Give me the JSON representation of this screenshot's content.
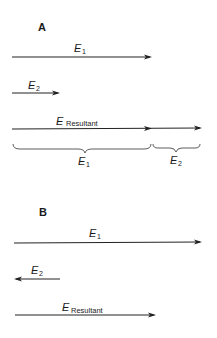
{
  "panels": [
    {
      "label": "A",
      "vectors": [
        {
          "name": "E1",
          "symbol": "E",
          "subscript": "1",
          "direction": "right",
          "x_start": 12,
          "x_end": 152
        },
        {
          "name": "E2",
          "symbol": "E",
          "subscript": "2",
          "direction": "right",
          "x_start": 12,
          "x_end": 60
        },
        {
          "name": "E_Resultant",
          "symbol": "E",
          "subscript": "Resultant",
          "direction": "right",
          "x_start": 12,
          "x_end": 202
        }
      ],
      "braces": [
        {
          "symbol": "E",
          "subscript": "1",
          "x_start": 13,
          "x_end": 151
        },
        {
          "symbol": "E",
          "subscript": "2",
          "x_start": 153,
          "x_end": 200
        }
      ]
    },
    {
      "label": "B",
      "vectors": [
        {
          "name": "E1",
          "symbol": "E",
          "subscript": "1",
          "direction": "right",
          "x_start": 14,
          "x_end": 202
        },
        {
          "name": "E2",
          "symbol": "E",
          "subscript": "2",
          "direction": "left",
          "x_start": 14,
          "x_end": 60
        },
        {
          "name": "E_Resultant",
          "symbol": "E",
          "subscript": "Resultant",
          "direction": "right",
          "x_start": 15,
          "x_end": 156
        }
      ]
    }
  ],
  "colors": {
    "ink": "#222222",
    "background": "#ffffff"
  }
}
